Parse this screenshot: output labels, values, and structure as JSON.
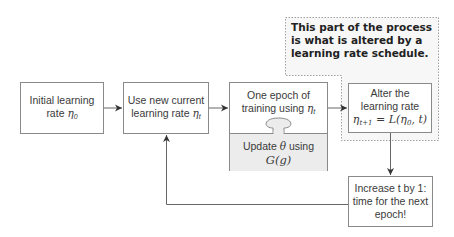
{
  "diagram": {
    "title": "",
    "note": "This part of the process is what is altered by a learning rate schedule.",
    "boxes": {
      "initial": {
        "line1": "Initial learning",
        "line2": "rate ",
        "math": "η",
        "sub": "0"
      },
      "use_current": {
        "line1": "Use new current",
        "line2": "learning rate ",
        "math": "η",
        "sub": "t"
      },
      "epoch_top": {
        "line1": "One epoch of",
        "line2": "training using ",
        "math": "η",
        "sub": "t"
      },
      "epoch_bottom": {
        "line1": "Update ",
        "theta": "θ",
        "line1b": " using",
        "line2": "G(g)"
      },
      "alter": {
        "line1": "Alter the",
        "line2": "learning rate",
        "formula": "η",
        "formula_sub": "t+1",
        "formula_rest": " = L(η",
        "formula_sub2": "0",
        "formula_end": ", t)"
      },
      "increase": {
        "line1": "Increase t by 1:",
        "line2": "time for the next",
        "line3": "epoch!"
      }
    },
    "colors": {
      "box_border": "#8a8a8a",
      "update_fill": "#ececec",
      "dotted_border": "#a0a0a0",
      "dotted_fill": "#f7f7f7",
      "arrow": "#555555"
    }
  }
}
